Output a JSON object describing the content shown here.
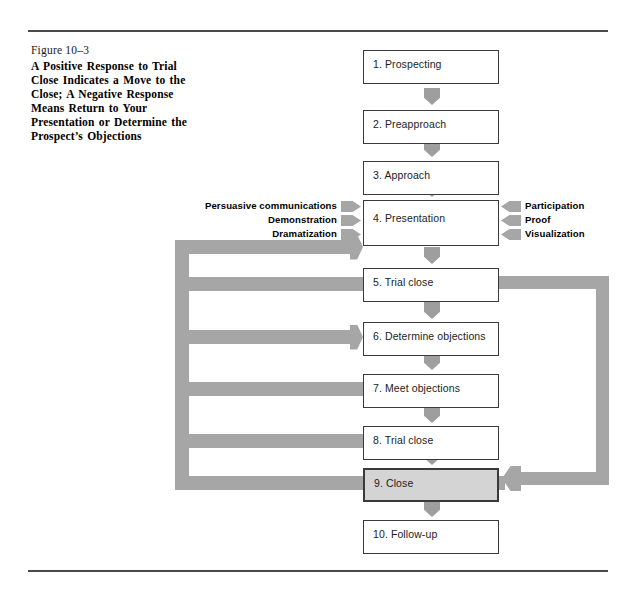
{
  "figure": {
    "number": "Figure 10–3",
    "title": "A Positive Response to Trial Close Indicates a Move to the Close; A Negative Response Means Return to Your Presentation or Determine the Prospect’s Objections"
  },
  "colors": {
    "arrow_gray": "#a6a6a6",
    "connector_gray": "#9e9e9e",
    "highlight_fill": "#d4d4d4",
    "box_border": "#3a3a3a",
    "rule": "#4a4a4a",
    "page_background": "#ffffff"
  },
  "flow": {
    "steps": [
      {
        "label": "1.  Prospecting",
        "top": 50,
        "height": 34,
        "highlight": false
      },
      {
        "label": "2.  Preapproach",
        "top": 110,
        "height": 34,
        "highlight": false
      },
      {
        "label": "3.  Approach",
        "top": 161,
        "height": 34,
        "highlight": false
      },
      {
        "label": "4.  Presentation",
        "top": 200,
        "height": 46,
        "highlight": false
      },
      {
        "label": "5.  Trial close",
        "top": 268,
        "height": 34,
        "highlight": false
      },
      {
        "label": "6.  Determine objections",
        "top": 322,
        "height": 34,
        "highlight": false
      },
      {
        "label": "7.  Meet objections",
        "top": 374,
        "height": 34,
        "highlight": false
      },
      {
        "label": "8.  Trial close",
        "top": 426,
        "height": 34,
        "highlight": false
      },
      {
        "label": "9.  Close",
        "top": 468,
        "height": 34,
        "highlight": true
      },
      {
        "label": "10.  Follow-up",
        "top": 520,
        "height": 34,
        "highlight": false
      }
    ],
    "connectors": [
      {
        "top": 88
      },
      {
        "top": 140
      },
      {
        "top": 180
      },
      {
        "top": 247
      },
      {
        "top": 302
      },
      {
        "top": 353
      },
      {
        "top": 406
      },
      {
        "top": 448
      },
      {
        "top": 500
      }
    ]
  },
  "presentation_inputs": {
    "left": [
      {
        "text": "Persuasive communications",
        "top": 200
      },
      {
        "text": "Demonstration",
        "top": 214
      },
      {
        "text": "Dramatization",
        "top": 228
      }
    ],
    "right": [
      {
        "text": "Participation",
        "top": 200
      },
      {
        "text": "Proof",
        "top": 214
      },
      {
        "text": "Visualization",
        "top": 228
      }
    ]
  },
  "feedback_loops": {
    "left": {
      "branches": [
        {
          "top": 240,
          "width": 188,
          "arrow": true,
          "target": "4.  Presentation"
        },
        {
          "top": 277,
          "width": 188,
          "arrow": false,
          "target": "5.  Trial close"
        },
        {
          "top": 330,
          "width": 188,
          "arrow": true,
          "target": "6.  Determine objections"
        },
        {
          "top": 382,
          "width": 188,
          "arrow": false,
          "target": "7.  Meet objections"
        },
        {
          "top": 434,
          "width": 188,
          "arrow": false,
          "target": "8.  Trial close"
        }
      ]
    },
    "right": {
      "from": "5.  Trial close",
      "to": "9.  Close"
    }
  }
}
